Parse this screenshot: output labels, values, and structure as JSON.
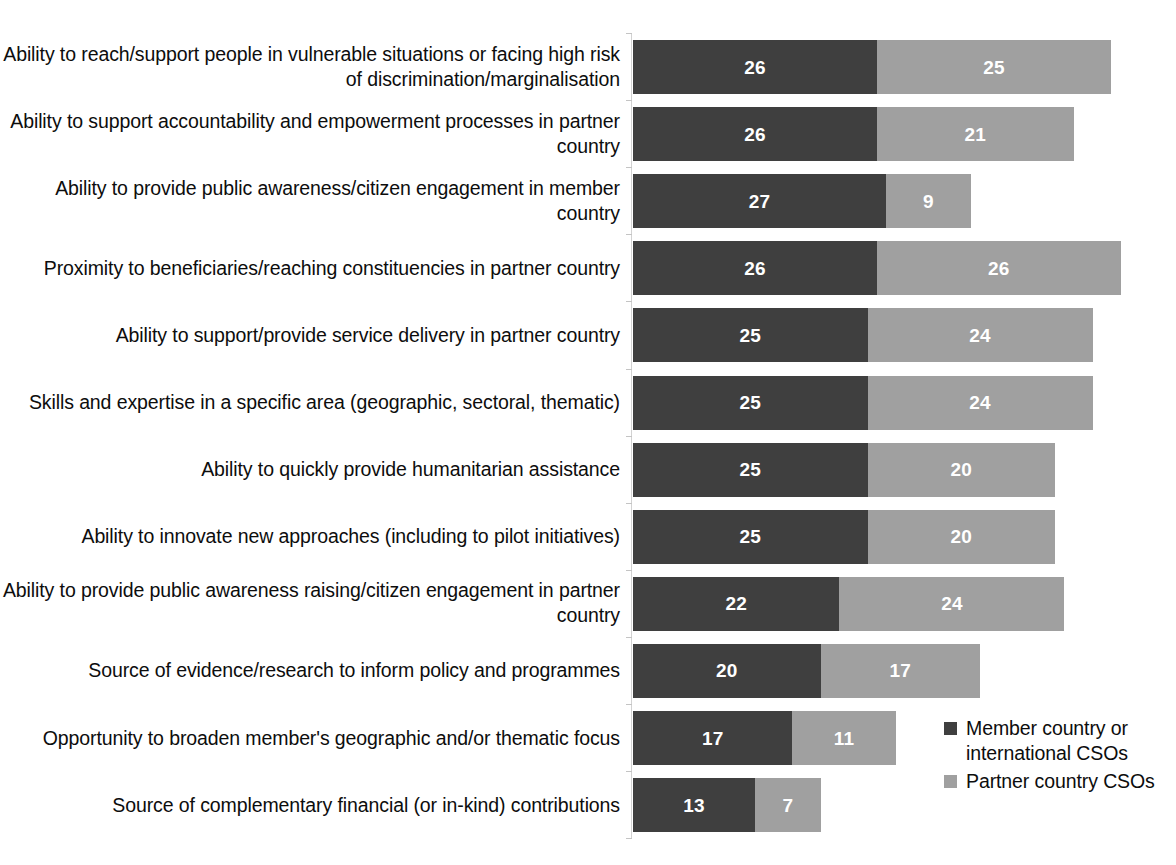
{
  "chart_data": {
    "type": "bar",
    "orientation": "horizontal",
    "stacked": true,
    "title": "",
    "xlabel": "",
    "ylabel": "",
    "grid": false,
    "legend_position": "bottom-right",
    "axis_max": 53,
    "categories": [
      "Ability to reach/support people in vulnerable situations or facing high risk of discrimination/marginalisation",
      "Ability to support accountability and empowerment processes in partner country",
      "Ability to provide public awareness/citizen engagement in member country",
      "Proximity to beneficiaries/reaching constituencies in partner country",
      "Ability to support/provide service delivery in partner country",
      "Skills and expertise in a specific area (geographic, sectoral, thematic)",
      "Ability to quickly provide humanitarian assistance",
      "Ability to innovate new approaches (including to pilot initiatives)",
      "Ability to provide public awareness raising/citizen engagement in partner country",
      "Source of evidence/research to inform policy and programmes",
      "Opportunity to broaden member's geographic and/or thematic focus",
      "Source of complementary financial (or in-kind) contributions"
    ],
    "series": [
      {
        "name": "Member country or international CSOs",
        "color": "#3f3f3f",
        "values": [
          26,
          26,
          27,
          26,
          25,
          25,
          25,
          25,
          22,
          20,
          17,
          13
        ]
      },
      {
        "name": "Partner country CSOs",
        "color": "#a0a0a0",
        "values": [
          25,
          21,
          9,
          26,
          24,
          24,
          20,
          20,
          24,
          17,
          11,
          7
        ]
      }
    ],
    "totals": [
      51,
      47,
      36,
      52,
      49,
      49,
      45,
      45,
      46,
      37,
      28,
      20
    ]
  },
  "legend": {
    "items": [
      {
        "label": "Member country or international CSOs",
        "color": "#3f3f3f"
      },
      {
        "label": "Partner country CSOs",
        "color": "#a0a0a0"
      }
    ]
  }
}
